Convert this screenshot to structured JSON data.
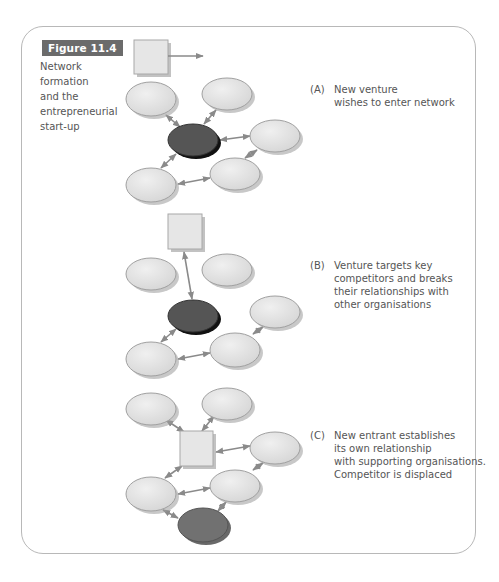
{
  "figure": {
    "label": "Figure 11.4",
    "caption_lines": [
      "Network",
      "formation",
      "and the",
      "entrepreneurial",
      "start-up"
    ]
  },
  "panels": [
    {
      "id": "A",
      "label": "(A)",
      "text_lines": [
        "New venture",
        "wishes to enter network"
      ]
    },
    {
      "id": "B",
      "label": "(B)",
      "text_lines": [
        "Venture targets key",
        "competitors and breaks",
        "their relationships with",
        "other organisations"
      ]
    },
    {
      "id": "C",
      "label": "(C)",
      "text_lines": [
        "New entrant establishes",
        "its own relationship",
        "with supporting organisations.",
        "Competitor is displaced"
      ]
    }
  ],
  "colors": {
    "node_fill": "#e3e3e3",
    "node_stroke": "#9a9a9a",
    "competitor_fill": "#555555",
    "displaced_fill": "#717171",
    "new_venture_fill": "#e6e6e6",
    "arrow": "#8a8a8a",
    "label_bg": "#6b6b6b"
  }
}
